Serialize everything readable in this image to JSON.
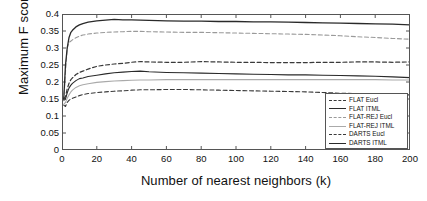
{
  "chart_data": {
    "type": "line",
    "title": "",
    "xlabel": "Number of nearest neighbors (k)",
    "ylabel": "Maximum F score",
    "xlim": [
      0,
      200
    ],
    "ylim": [
      0,
      0.4
    ],
    "xticks": [
      0,
      20,
      40,
      60,
      80,
      100,
      120,
      140,
      160,
      180,
      200
    ],
    "xticklabels": [
      "0",
      "20",
      "40",
      "60",
      "80",
      "100",
      "120",
      "140",
      "160",
      "180",
      "200"
    ],
    "yticks": [
      0,
      0.05,
      0.1,
      0.15,
      0.2,
      0.25,
      0.3,
      0.35,
      0.4
    ],
    "yticklabels": [
      "0",
      "0.05",
      "0.1",
      "0.15",
      "0.2",
      "0.25",
      "0.3",
      "0.35",
      "0.4"
    ],
    "grid": false,
    "legend_position": "lower right",
    "x": [
      1,
      2,
      3,
      4,
      5,
      6,
      8,
      10,
      12,
      15,
      20,
      25,
      30,
      35,
      40,
      45,
      50,
      60,
      70,
      80,
      90,
      100,
      110,
      120,
      130,
      140,
      150,
      160,
      170,
      180,
      190,
      200
    ],
    "series": [
      {
        "name": "FLAT Eucl",
        "style": "dashed",
        "color": "#3a3a3a",
        "width": 1.1,
        "values": [
          0.132,
          0.128,
          0.14,
          0.146,
          0.15,
          0.152,
          0.156,
          0.16,
          0.163,
          0.166,
          0.169,
          0.171,
          0.173,
          0.174,
          0.176,
          0.177,
          0.177,
          0.178,
          0.178,
          0.177,
          0.176,
          0.175,
          0.174,
          0.173,
          0.172,
          0.171,
          0.169,
          0.167,
          0.166,
          0.164,
          0.163,
          0.162
        ]
      },
      {
        "name": "FLAT ITML",
        "style": "solid",
        "color": "#2a2a2a",
        "width": 1.1,
        "values": [
          0.146,
          0.15,
          0.168,
          0.182,
          0.19,
          0.196,
          0.204,
          0.21,
          0.212,
          0.216,
          0.22,
          0.224,
          0.227,
          0.229,
          0.231,
          0.232,
          0.23,
          0.228,
          0.227,
          0.226,
          0.225,
          0.224,
          0.223,
          0.222,
          0.221,
          0.221,
          0.22,
          0.219,
          0.218,
          0.217,
          0.215,
          0.213
        ]
      },
      {
        "name": "FLAT-REJ Eucl",
        "style": "dashed",
        "color": "#9a9a9a",
        "width": 1.1,
        "values": [
          0.145,
          0.23,
          0.3,
          0.316,
          0.32,
          0.324,
          0.33,
          0.335,
          0.338,
          0.341,
          0.344,
          0.346,
          0.347,
          0.348,
          0.349,
          0.349,
          0.348,
          0.347,
          0.346,
          0.346,
          0.345,
          0.344,
          0.343,
          0.342,
          0.341,
          0.34,
          0.338,
          0.336,
          0.333,
          0.331,
          0.328,
          0.326
        ]
      },
      {
        "name": "FLAT-REJ ITML",
        "style": "solid",
        "color": "#aaaaaa",
        "width": 1.1,
        "values": [
          0.134,
          0.14,
          0.152,
          0.162,
          0.17,
          0.176,
          0.184,
          0.189,
          0.192,
          0.195,
          0.199,
          0.201,
          0.203,
          0.204,
          0.205,
          0.206,
          0.206,
          0.207,
          0.207,
          0.207,
          0.207,
          0.207,
          0.207,
          0.207,
          0.207,
          0.207,
          0.207,
          0.207,
          0.207,
          0.207,
          0.206,
          0.206
        ]
      },
      {
        "name": "DARTS Eucl",
        "style": "dashed",
        "color": "#3a3a3a",
        "width": 1.2,
        "values": [
          0.15,
          0.156,
          0.18,
          0.196,
          0.206,
          0.212,
          0.222,
          0.228,
          0.232,
          0.238,
          0.246,
          0.25,
          0.253,
          0.255,
          0.258,
          0.26,
          0.259,
          0.258,
          0.258,
          0.26,
          0.259,
          0.258,
          0.258,
          0.257,
          0.257,
          0.257,
          0.258,
          0.258,
          0.259,
          0.259,
          0.258,
          0.259
        ]
      },
      {
        "name": "DARTS ITML",
        "style": "solid",
        "color": "#2a2a2a",
        "width": 1.3,
        "values": [
          0.15,
          0.25,
          0.3,
          0.33,
          0.345,
          0.352,
          0.362,
          0.368,
          0.372,
          0.376,
          0.38,
          0.382,
          0.384,
          0.383,
          0.383,
          0.382,
          0.381,
          0.38,
          0.379,
          0.379,
          0.378,
          0.378,
          0.377,
          0.377,
          0.376,
          0.375,
          0.374,
          0.373,
          0.372,
          0.371,
          0.37,
          0.368
        ]
      }
    ]
  },
  "axes": {
    "frame_color": "#555555"
  }
}
